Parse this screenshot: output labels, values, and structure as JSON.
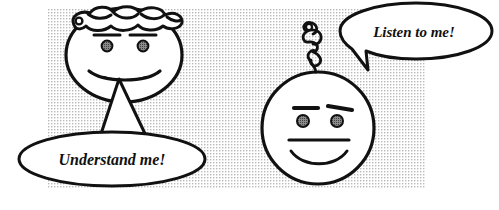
{
  "scene": {
    "title": "Two cartoon faces with speech bubbles",
    "width": 499,
    "height": 210,
    "background_color": "#ffffff",
    "halftone_color": "#c9c9c9",
    "ink_color": "#111111",
    "halftone_region": {
      "x": 48,
      "y": 8,
      "width": 377,
      "height": 180
    }
  },
  "characters": [
    {
      "id": "left-character",
      "head_shape": "oval",
      "hair_style": "wavy-curls-across-top",
      "expression": "smiling",
      "eyes": 2,
      "eyebrows": 2,
      "position": {
        "cx": 124,
        "cy": 55,
        "rx": 58,
        "ry": 47
      }
    },
    {
      "id": "right-character",
      "head_shape": "circle",
      "hair_style": "single-curl-tuft",
      "expression": "smiling",
      "eyes": 2,
      "eyebrows": 2,
      "position": {
        "cx": 318,
        "cy": 128,
        "rx": 56,
        "ry": 56
      }
    }
  ],
  "speech_bubbles": [
    {
      "id": "left-bubble",
      "text": "Understand me!",
      "shape": "ellipse",
      "tail": "triangle-up",
      "speaker": "left-character",
      "position": {
        "cx": 112,
        "cy": 159,
        "rx": 93,
        "ry": 27
      },
      "text_x": 112,
      "text_y": 165
    },
    {
      "id": "right-bubble",
      "text": "Listen to me!",
      "shape": "ellipse",
      "tail": "pointer-down-left",
      "speaker": "right-character",
      "position": {
        "cx": 416,
        "cy": 31,
        "rx": 76,
        "ry": 28
      },
      "text_x": 414,
      "text_y": 37
    }
  ]
}
